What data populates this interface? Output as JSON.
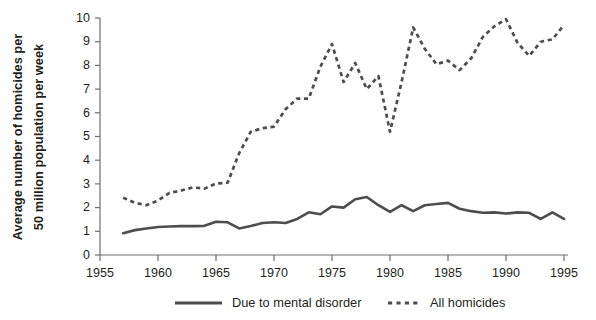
{
  "chart_data": {
    "type": "line",
    "title": "",
    "xlabel": "",
    "ylabel": "Average number of homicides per 50 million population per week",
    "ylabel_line1": "Average number of homicides per",
    "ylabel_line2": "50 million population per week",
    "xlim": [
      1955,
      1995
    ],
    "ylim": [
      0,
      10
    ],
    "grid": false,
    "legend_position": "bottom",
    "xticks": [
      1955,
      1960,
      1965,
      1970,
      1975,
      1980,
      1985,
      1990,
      1995
    ],
    "yticks": [
      0,
      1,
      2,
      3,
      4,
      5,
      6,
      7,
      8,
      9,
      10
    ],
    "series": [
      {
        "name": "Due to mental disorder",
        "style": "solid",
        "color": "#4d4d4f",
        "x": [
          1957,
          1958,
          1959,
          1960,
          1961,
          1962,
          1963,
          1964,
          1965,
          1966,
          1967,
          1968,
          1969,
          1970,
          1971,
          1972,
          1973,
          1974,
          1975,
          1976,
          1977,
          1978,
          1979,
          1980,
          1981,
          1982,
          1983,
          1984,
          1985,
          1986,
          1987,
          1988,
          1989,
          1990,
          1991,
          1992,
          1993,
          1994,
          1995
        ],
        "values": [
          0.92,
          1.05,
          1.12,
          1.18,
          1.2,
          1.22,
          1.22,
          1.23,
          1.4,
          1.38,
          1.12,
          1.22,
          1.35,
          1.38,
          1.35,
          1.52,
          1.8,
          1.72,
          2.05,
          2.0,
          2.35,
          2.45,
          2.1,
          1.82,
          2.1,
          1.85,
          2.1,
          2.15,
          2.2,
          1.95,
          1.85,
          1.78,
          1.8,
          1.75,
          1.8,
          1.78,
          1.52,
          1.8,
          1.52
        ]
      },
      {
        "name": "All homicides",
        "style": "dashed",
        "color": "#4d4d4f",
        "x": [
          1957,
          1958,
          1959,
          1960,
          1961,
          1962,
          1963,
          1964,
          1965,
          1966,
          1967,
          1968,
          1969,
          1970,
          1971,
          1972,
          1973,
          1974,
          1975,
          1976,
          1977,
          1978,
          1979,
          1980,
          1981,
          1982,
          1983,
          1984,
          1985,
          1986,
          1987,
          1988,
          1989,
          1990,
          1991,
          1992,
          1993,
          1994,
          1995
        ],
        "values": [
          2.42,
          2.2,
          2.1,
          2.3,
          2.62,
          2.72,
          2.85,
          2.8,
          3.02,
          3.05,
          4.3,
          5.2,
          5.35,
          5.42,
          6.15,
          6.6,
          6.6,
          7.95,
          8.9,
          7.3,
          8.1,
          7.0,
          7.55,
          5.2,
          7.3,
          9.6,
          8.7,
          8.05,
          8.2,
          7.8,
          8.3,
          9.2,
          9.65,
          9.95,
          8.95,
          8.4,
          9.0,
          9.1,
          9.7
        ]
      }
    ]
  },
  "legend": {
    "items": [
      {
        "label": "Due to mental disorder",
        "style": "solid"
      },
      {
        "label": "All homicides",
        "style": "dashed"
      }
    ]
  }
}
